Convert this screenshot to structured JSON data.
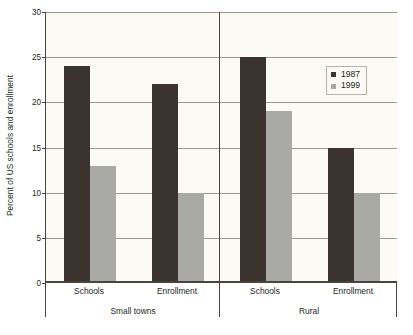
{
  "chart_data": {
    "type": "bar",
    "title": "",
    "xlabel": "",
    "ylabel": "Percent of US schools and enrollment",
    "ylim": [
      0,
      30
    ],
    "ytick_labels": [
      "0",
      "5",
      "10",
      "15",
      "20",
      "25",
      "30"
    ],
    "yticks": [
      0,
      5,
      10,
      15,
      20,
      25,
      30
    ],
    "grid": true,
    "legend_position": "top-right",
    "groups": [
      "Small towns",
      "Rural"
    ],
    "categories": [
      "Schools",
      "Enrollment",
      "Schools",
      "Enrollment"
    ],
    "series": [
      {
        "name": "1987",
        "color": "#3a332e",
        "values": [
          24,
          22,
          25,
          15
        ]
      },
      {
        "name": "1999",
        "color": "#a8a8a5",
        "values": [
          13,
          10,
          19,
          10
        ]
      }
    ]
  },
  "legend": {
    "entries": [
      {
        "label": "1987"
      },
      {
        "label": "1999"
      }
    ]
  },
  "axis": {
    "y_title": "Percent of US schools and enrollment"
  },
  "colors": {
    "series_1987": "#3a332e",
    "series_1999": "#a8a8a5",
    "plot_background": "#fbfaf5",
    "axis": "#4a4440",
    "gridline": "#9d9892",
    "text": "#231f1c"
  }
}
